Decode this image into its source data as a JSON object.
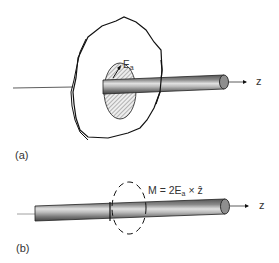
{
  "figure": {
    "panel_a": {
      "label": "(a)",
      "axis_label": "z",
      "field_label": "E",
      "field_subscript": "a"
    },
    "panel_b": {
      "label": "(b)",
      "axis_label": "z",
      "equation_prefix": "M = 2E",
      "equation_subscript": "a",
      "equation_suffix": " × ẑ"
    }
  },
  "colors": {
    "line": "#111111",
    "rod_dark": "#6a6a6a",
    "rod_light": "#d0d0d0",
    "hatch": "#888888"
  }
}
